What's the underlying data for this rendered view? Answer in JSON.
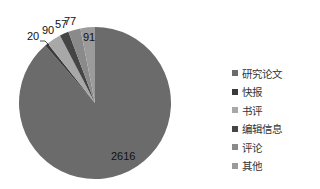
{
  "chart_data": {
    "type": "pie",
    "title": "",
    "categories": [
      "研究论文",
      "快报",
      "书评",
      "编辑信息",
      "评论",
      "其他"
    ],
    "values": [
      2616,
      20,
      90,
      57,
      77,
      91
    ],
    "colors": [
      "#6b6b6b",
      "#3a3a3a",
      "#a8a8a8",
      "#454545",
      "#8a8a8a",
      "#9b9b9b"
    ],
    "legend_position": "right",
    "data_labels": [
      "2616",
      "20",
      "90",
      "57",
      "77",
      "91"
    ]
  },
  "legend": {
    "items": [
      {
        "label": "研究论文",
        "color": "#6b6b6b"
      },
      {
        "label": "快报",
        "color": "#3a3a3a"
      },
      {
        "label": "书评",
        "color": "#a8a8a8"
      },
      {
        "label": "编辑信息",
        "color": "#454545"
      },
      {
        "label": "评论",
        "color": "#8a8a8a"
      },
      {
        "label": "其他",
        "color": "#9b9b9b"
      }
    ]
  },
  "labels": {
    "l2616": "2616",
    "l20": "20",
    "l90": "90",
    "l57": "57",
    "l77": "77",
    "l91": "91"
  }
}
